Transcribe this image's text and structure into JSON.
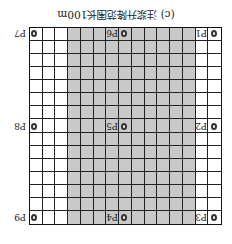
{
  "caption": "(c) 注浆升降范围长100m",
  "grid": {
    "cols": 15,
    "rows": 15,
    "shaded_col_start": 3,
    "shaded_col_end": 13
  },
  "colors": {
    "shade": "#c9c9c9",
    "line": "#222222"
  },
  "points": [
    {
      "id": "p1",
      "label": "P1"
    },
    {
      "id": "p2",
      "label": "P2"
    },
    {
      "id": "p3",
      "label": "P3"
    },
    {
      "id": "p4",
      "label": "P4"
    },
    {
      "id": "p5",
      "label": "P5"
    },
    {
      "id": "p6",
      "label": "P6"
    },
    {
      "id": "p7",
      "label": "P7"
    },
    {
      "id": "p8",
      "label": "P8"
    },
    {
      "id": "p9",
      "label": "P9"
    }
  ]
}
